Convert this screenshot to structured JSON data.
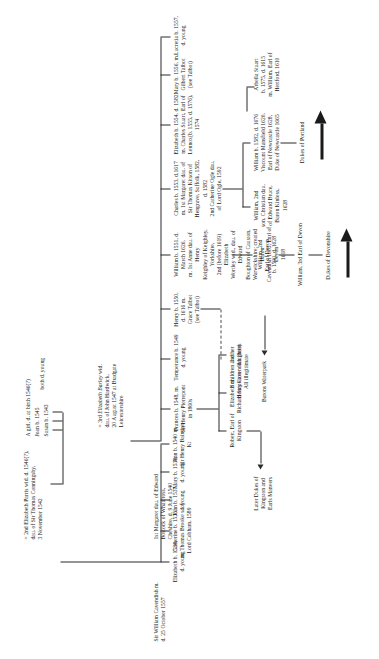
{
  "root": {
    "name": "Sir William Cavendish m.\nd. 25 October 1557",
    "marriage1": "1st Margaret dau. of Edward\nBostock of Whatcross,\nCheshire, d. 9 June 1540",
    "marriage2": "= 2nd Elizabeth Parris wid. d. 1546(?),\ndau. of Sir Thomas Conningsby,\n3 November 1542",
    "marriage3_pre": "= 3rd ",
    "marriage3_it": "Elizabeth Barley",
    "marriage3_post": " wid.\ndau. of John Hardwick,\n20 August 1547 at Bradgate\nLeicestershire"
  },
  "gen1_first_marriage": [
    {
      "id": "elizabeth-1534",
      "text": "Elizabeth b. 1534,\nd. young"
    },
    {
      "id": "catherine-1535",
      "text": "Catherine b. 1535,\nm. Thomas Brooke s. of\nLord Cobham, 1589"
    },
    {
      "id": "john-1537",
      "text": "John b. 1537,\nd. young"
    },
    {
      "id": "mary-1538",
      "text": "Mary b. 1538,\nd. young"
    },
    {
      "id": "ann-1540",
      "text": "Ann b. 1540 m.\nSir Henry Baintion\nKt"
    }
  ],
  "gen1_second_marriage": [
    {
      "id": "susan-1543",
      "text": "Susan  b. 1543"
    },
    {
      "id": "joan-1545",
      "text": "Joan   b. 1545"
    },
    {
      "id": "girl-1546",
      "text": "A girl, d. at birth 1546(?)"
    }
  ],
  "gen1_second_marriage_brace_note": "both d. young",
  "gen1_third_marriage": [
    {
      "id": "frances-1548",
      "text": "Frances b. 1548, m.\nSir Henry Pierrepont\nin 1860s"
    },
    {
      "id": "temperance-1549",
      "text": "Temperance b. 1549\nd. young"
    },
    {
      "id": "henry-1550",
      "text": "Henry b. 1550,\nd. 1616 m.\nGrace Talbot\n(see Talbot)"
    },
    {
      "id": "william-1551",
      "text": "William b. 1551, d. March 1626,\nm. 1st Anne dau. of Henry\nKeighley of Keighley, Yorkshire,\n2nd (before 1619) Elizabeth\nWortley wid., dau. of Edward\nBoughton of Causton,\nWarwickshire; created Baron\nCavendish 1605, Earl of Devon\n1618"
    },
    {
      "id": "charles-1553",
      "text": "Charles b. 1553, d.1617\nm. 1st Margaret dau. of\nSir Thomas Kitson of\nHengrave, Suffolk, 1582,\nd. 1582\n2nd Catherine Ogle dau.\nof Lord Ogle, 1592"
    },
    {
      "id": "elizabeth-1554",
      "text": "Elizabeth b. 1554, d. 1582\nm. Charles Stuart, Earl of\nLennox(b. 1555, d. 1576),\n1574"
    },
    {
      "id": "mary-1556",
      "text": "Mary b. 1556, m.\nGilbert Talbot\n(see Talbot)"
    },
    {
      "id": "lucretia-1557",
      "text": "Lucretia b. 1557,\nd. young"
    }
  ],
  "gen2": [
    {
      "id": "robert-kingston",
      "text": "Robert, Earl of\nKingston"
    },
    {
      "id": "elizabeth-stapleton",
      "text": "Elizabeth m.\nRichard Stapleton"
    },
    {
      "id": "three-daughters",
      "text": "3 other\ndaughters"
    },
    {
      "id": "eight-children",
      "text": "8 children and\nHenry Cavendish (heir)\nAll illegitimate"
    },
    {
      "id": "william-2nd-earl",
      "text": "William, 2nd\nEarl of Devon,\nb. 1590, d. 1628"
    },
    {
      "id": "william-3rd-earl",
      "text": "William, 3rd Earl of Devon"
    },
    {
      "id": "charles-2nd",
      "text": "William, 2nd\nson. Christian dau.\nof Edward Bruce,\nBaron Kinloss,\n1628"
    },
    {
      "id": "william-1582",
      "text": "William b. 1582, d. 1676\nViscount Mansfield 1620,\nEarl of Newcastle 1628,\nDuke of Newcastle 1665"
    },
    {
      "id": "arbella-stuart",
      "text": "Arbella Stuart\nb. 1575, d. 1615\nm. William, Earl of\nHertford, 1610"
    }
  ],
  "continuations": [
    {
      "id": "later-dukes-kingston",
      "text": "Later Dukes of\nKingston and\nEarls Manvers"
    },
    {
      "id": "barons-waterpark",
      "text": "Barons Waterpark"
    },
    {
      "id": "dukes-devonshire",
      "text": "Dukes of Devonshire"
    },
    {
      "id": "dukes-portland",
      "text": "Dukes of Portland"
    }
  ]
}
